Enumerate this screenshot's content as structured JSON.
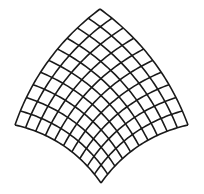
{
  "figure": {
    "title": "",
    "grid": {
      "divisions_u": 10,
      "divisions_v": 10,
      "corners": {
        "top": [
          100,
          9
        ],
        "left": [
          15,
          125
        ],
        "right": [
          188,
          125
        ],
        "bottom": [
          101,
          183
        ]
      },
      "upper_edge_bulge": 11,
      "lower_edge_bulge": 10
    },
    "style": {
      "stroke_color": "#1a1a1a",
      "stroke_width": 1.6,
      "background": "#ffffff"
    }
  }
}
